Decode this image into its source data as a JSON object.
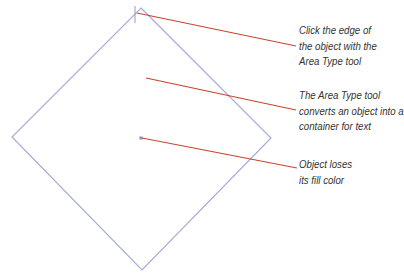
{
  "diagram": {
    "shape": {
      "type": "diamond",
      "stroke_color": "#a9aad8",
      "points": {
        "top": [
          141,
          8
        ],
        "right": [
          271,
          138
        ],
        "bottom": [
          142,
          270
        ],
        "left": [
          12,
          137
        ]
      },
      "center_point": [
        141,
        138
      ]
    },
    "cursor_mark": {
      "icon": "text-insertion-cursor",
      "x": 135,
      "y1": 6,
      "y2": 23
    },
    "leader_color": "#c8462e",
    "callouts": [
      {
        "id": "click-edge",
        "lines": [
          "Click the edge of",
          "the object with the",
          "Area Type tool"
        ],
        "leader": {
          "from": [
            137,
            13
          ],
          "to": [
            296,
            46
          ]
        }
      },
      {
        "id": "area-type-converts",
        "lines": [
          "The Area Type tool",
          "converts an object into a",
          "container for text"
        ],
        "leader": {
          "from": [
            146,
            78
          ],
          "to": [
            296,
            110
          ]
        }
      },
      {
        "id": "loses-fill",
        "lines": [
          "Object loses",
          "its fill color"
        ],
        "leader": {
          "from": [
            142,
            138
          ],
          "to": [
            297,
            168
          ]
        }
      }
    ]
  }
}
